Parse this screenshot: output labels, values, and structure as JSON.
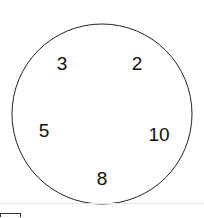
{
  "diagram": {
    "shape": "circle",
    "circle": {
      "cx": 102,
      "cy": 114,
      "r": 90,
      "stroke": "#222222"
    },
    "numbers": [
      {
        "label": "3",
        "x": 62,
        "y": 70
      },
      {
        "label": "2",
        "x": 137,
        "y": 70
      },
      {
        "label": "5",
        "x": 44,
        "y": 137
      },
      {
        "label": "10",
        "x": 159,
        "y": 141
      },
      {
        "label": "8",
        "x": 102,
        "y": 185
      }
    ]
  },
  "footer": {
    "divider_color": "#e6e6e6",
    "answer_box": true
  }
}
